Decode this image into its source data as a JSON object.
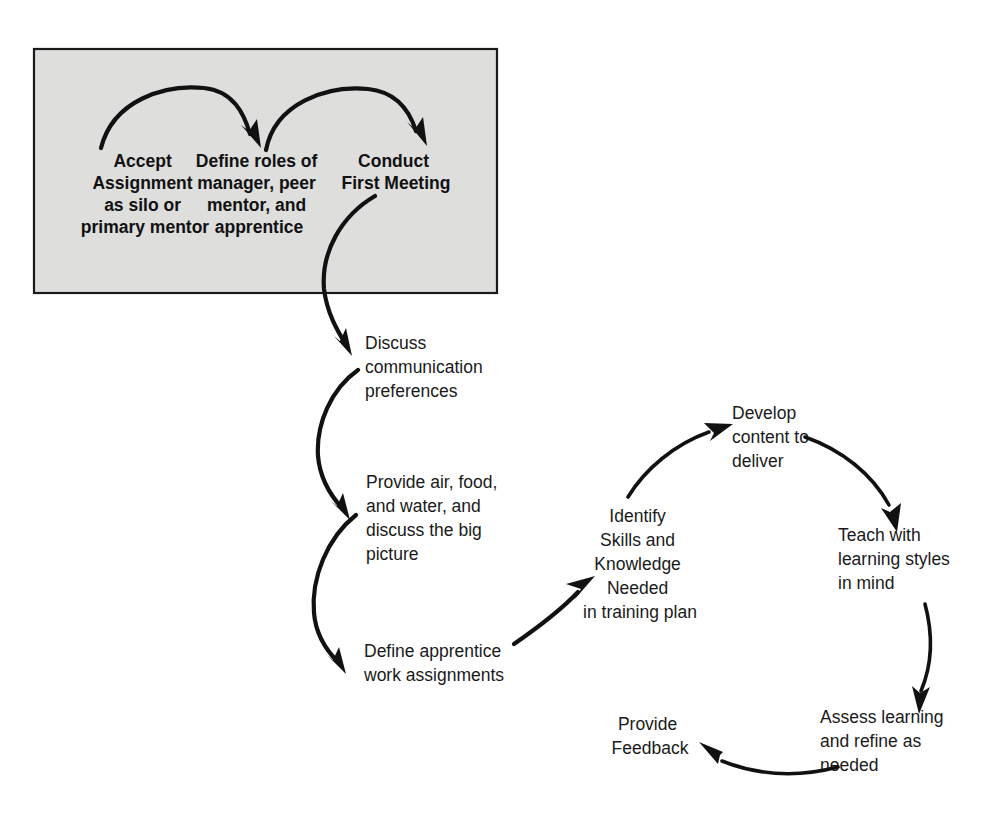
{
  "diagram": {
    "colors": {
      "box_fill": "#dededd",
      "box_border": "#1a1a1a",
      "arrow": "#111111",
      "text": "#1a1a1a",
      "background": "#ffffff"
    },
    "setup_box": {
      "steps": [
        {
          "id": "accept-assignment",
          "lines": [
            "Accept",
            "Assignment",
            "as silo or",
            "primary mentor"
          ]
        },
        {
          "id": "define-roles",
          "lines": [
            "Define roles of",
            "manager, peer",
            "mentor, and",
            "apprentice"
          ]
        },
        {
          "id": "conduct-first-meeting",
          "lines": [
            "Conduct",
            "First Meeting"
          ]
        }
      ]
    },
    "vertical_steps": [
      {
        "id": "discuss-communication-preferences",
        "lines": [
          "Discuss",
          "communication",
          "preferences"
        ]
      },
      {
        "id": "provide-air-food-water",
        "lines": [
          "Provide air, food,",
          "and water, and",
          "discuss the big",
          "picture"
        ]
      },
      {
        "id": "define-work-assignments",
        "lines": [
          "Define apprentice",
          "work assignments"
        ]
      }
    ],
    "cycle_steps": [
      {
        "id": "identify-skills-knowledge",
        "lines": [
          "Identify",
          "Skills and",
          "Knowledge",
          "Needed",
          "in training plan"
        ]
      },
      {
        "id": "develop-content",
        "lines": [
          "Develop",
          "content to",
          "deliver"
        ]
      },
      {
        "id": "teach-learning-styles",
        "lines": [
          "Teach with",
          "learning styles",
          "in mind"
        ]
      },
      {
        "id": "assess-learning",
        "lines": [
          "Assess learning",
          "and refine as",
          "needed"
        ]
      },
      {
        "id": "provide-feedback",
        "lines": [
          "Provide",
          "Feedback"
        ]
      }
    ],
    "connectors": [
      {
        "id": "accept-to-define",
        "from": "accept-assignment",
        "to": "define-roles"
      },
      {
        "id": "define-to-conduct",
        "from": "define-roles",
        "to": "conduct-first-meeting"
      },
      {
        "id": "conduct-to-discuss",
        "from": "conduct-first-meeting",
        "to": "discuss-communication-preferences"
      },
      {
        "id": "discuss-to-provide",
        "from": "discuss-communication-preferences",
        "to": "provide-air-food-water"
      },
      {
        "id": "provide-to-define-work",
        "from": "provide-air-food-water",
        "to": "define-work-assignments"
      },
      {
        "id": "define-work-to-identify",
        "from": "define-work-assignments",
        "to": "identify-skills-knowledge"
      },
      {
        "id": "identify-to-develop",
        "from": "identify-skills-knowledge",
        "to": "develop-content"
      },
      {
        "id": "develop-to-teach",
        "from": "develop-content",
        "to": "teach-learning-styles"
      },
      {
        "id": "teach-to-assess",
        "from": "teach-learning-styles",
        "to": "assess-learning"
      },
      {
        "id": "assess-to-feedback",
        "from": "assess-learning",
        "to": "provide-feedback"
      }
    ]
  }
}
